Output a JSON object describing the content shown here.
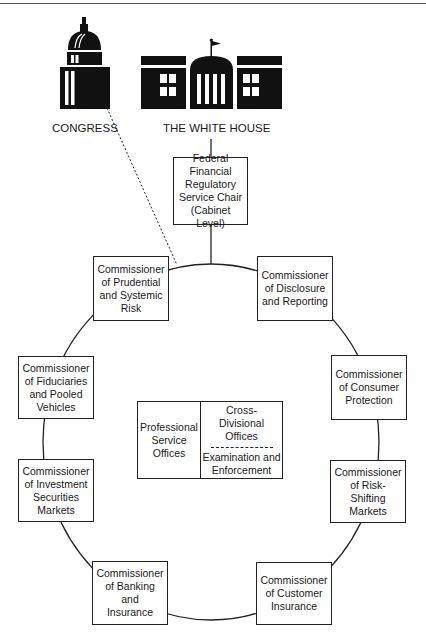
{
  "header": {
    "cut_off_text": ""
  },
  "icons": {
    "congress": {
      "name": "capitol-building-icon",
      "label": "CONGRESS"
    },
    "white_house": {
      "name": "white-house-icon",
      "label": "THE WHITE HOUSE"
    }
  },
  "chair": {
    "lines": [
      "Federal",
      "Financial",
      "Regulatory",
      "Service Chair",
      "(Cabinet Level)"
    ]
  },
  "commissioners": [
    {
      "id": "prudential",
      "lines": [
        "Commissioner",
        "of Prudential",
        "and Systemic",
        "Risk"
      ]
    },
    {
      "id": "disclosure",
      "lines": [
        "Commissioner",
        "of Disclosure",
        "and Reporting"
      ]
    },
    {
      "id": "fiduciaries",
      "lines": [
        "Commissioner",
        "of Fiduciaries",
        "and Pooled",
        "Vehicles"
      ]
    },
    {
      "id": "consumer",
      "lines": [
        "Commissioner",
        "of Consumer",
        "Protection"
      ]
    },
    {
      "id": "investment",
      "lines": [
        "Commissioner",
        "of Investment",
        "Securities",
        "Markets"
      ]
    },
    {
      "id": "risk_shifting",
      "lines": [
        "Commissioner",
        "of Risk-",
        "Shifting",
        "Markets"
      ]
    },
    {
      "id": "banking",
      "lines": [
        "Commissioner",
        "of Banking and",
        "Insurance"
      ]
    },
    {
      "id": "customer_insurance",
      "lines": [
        "Commissioner",
        "of Customer",
        "Insurance"
      ]
    }
  ],
  "center": {
    "left_lines": [
      "Professional",
      "Service",
      "Offices"
    ],
    "right_top_lines": [
      "Cross-",
      "Divisional",
      "Offices"
    ],
    "right_bottom_lines": [
      "Examination and",
      "Enforcement"
    ]
  },
  "colors": {
    "ink": "#1a1a1a",
    "background": "#ffffff"
  }
}
